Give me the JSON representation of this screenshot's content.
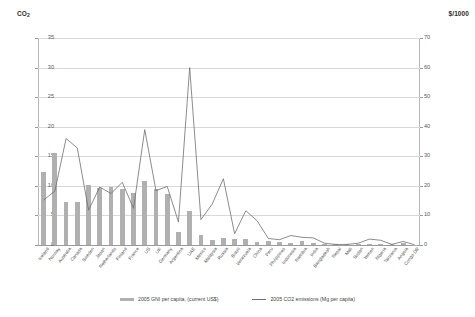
{
  "chart_data": {
    "type": "bar",
    "title": "",
    "xlabel": "",
    "ylabel": "CO2",
    "y2label": "$/1000",
    "ylim": [
      0,
      35
    ],
    "y2lim": [
      0,
      70
    ],
    "yticks": [
      0,
      5,
      10,
      15,
      20,
      25,
      30,
      35
    ],
    "y2ticks": [
      0,
      10,
      20,
      30,
      40,
      50,
      60,
      70
    ],
    "grid": true,
    "legend_position": "bottom",
    "categories": [
      "Iceland",
      "Norway",
      "Australia",
      "Canada",
      "Sweden",
      "Japan",
      "Netherlands",
      "Finland",
      "France",
      "US",
      "UK",
      "Germany",
      "Argentina",
      "UAE",
      "Mexico",
      "Malaysia",
      "Russia",
      "Brazil",
      "Venezuela",
      "China",
      "Peru",
      "Philippines",
      "Indonesia",
      "Namibia",
      "India",
      "Bangladesh",
      "Nepal",
      "Mali",
      "Sudan",
      "Yemen",
      "Nigeria",
      "Tanzania",
      "Angola",
      "Congo DR"
    ],
    "series": [
      {
        "name": "2005 GNI per capita, (current US$)",
        "unit": "$/1000",
        "axis": "right",
        "render": "bar",
        "color": "#b0b0b0",
        "values": [
          24.6,
          31.0,
          14.6,
          14.5,
          20.3,
          19.3,
          19.7,
          19.1,
          17.5,
          21.5,
          19.0,
          17.4,
          4.4,
          11.5,
          3.5,
          1.6,
          2.3,
          2.0,
          2.0,
          1.0,
          1.3,
          1.0,
          0.8,
          1.5,
          0.6,
          0.4,
          0.3,
          0.3,
          0.4,
          0.4,
          0.4,
          0.3,
          0.7,
          0.1
        ]
      },
      {
        "name": "2005 CO2 emissions (Mg per capita)",
        "unit": "Mg per capita",
        "axis": "left",
        "render": "line",
        "color": "#6f6f6f",
        "values": [
          7.6,
          9.1,
          18.0,
          16.4,
          5.9,
          9.8,
          8.7,
          10.6,
          6.2,
          19.5,
          9.2,
          9.9,
          3.9,
          30.0,
          4.3,
          6.9,
          11.2,
          1.9,
          5.8,
          4.1,
          1.1,
          0.9,
          1.6,
          1.3,
          1.2,
          0.3,
          0.1,
          0.1,
          0.3,
          1.0,
          0.8,
          0.1,
          0.6,
          0.05
        ]
      }
    ]
  },
  "legend": {
    "bar_label": "2005 GNI per capita, (current US$)",
    "line_label": "2005 CO2 emissions (Mg per capita)"
  },
  "axes": {
    "left_caption_main": "CO",
    "left_caption_sub": "2",
    "right_caption": "$/1000"
  }
}
